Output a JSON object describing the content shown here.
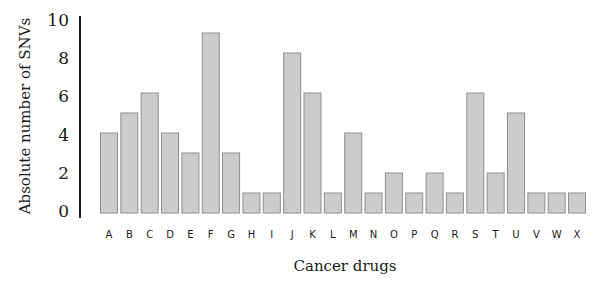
{
  "chart_data": {
    "type": "bar",
    "title": "",
    "xlabel": "Cancer drugs",
    "ylabel": "Absolute number of SNVs",
    "categories": [
      "A",
      "B",
      "C",
      "D",
      "E",
      "F",
      "G",
      "H",
      "I",
      "J",
      "K",
      "L",
      "M",
      "N",
      "O",
      "P",
      "Q",
      "R",
      "S",
      "T",
      "U",
      "V",
      "W",
      "X"
    ],
    "values": [
      4,
      5,
      6,
      4,
      3,
      9,
      3,
      1,
      1,
      8,
      6,
      1,
      4,
      1,
      2,
      1,
      2,
      1,
      6,
      2,
      5,
      1,
      1,
      1
    ],
    "ylim": [
      0,
      10
    ],
    "yticks": [
      0,
      2,
      4,
      6,
      8,
      10
    ],
    "grid": false,
    "legend": "none",
    "colors": {
      "bar_fill": "#cccccc",
      "bar_stroke": "#8f8f8f",
      "axis": "#222222"
    }
  }
}
